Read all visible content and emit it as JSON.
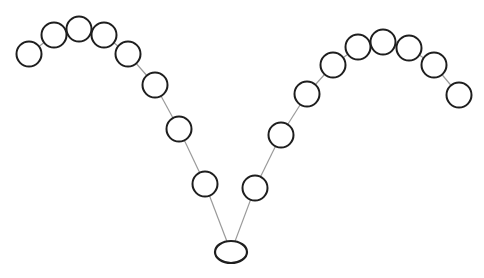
{
  "diagram": {
    "type": "node-chain",
    "background": "#ffffff",
    "node_stroke": "#1e1e1e",
    "link_stroke": "#9a9a9a",
    "node_radius": 12.5,
    "root": {
      "id": "root",
      "shape": "ellipse",
      "cx": 231,
      "cy": 252,
      "rx": 16,
      "ry": 11
    },
    "left_chain": [
      {
        "id": "L8",
        "cx": 205,
        "cy": 184
      },
      {
        "id": "L7",
        "cx": 179,
        "cy": 129
      },
      {
        "id": "L6",
        "cx": 155,
        "cy": 85
      },
      {
        "id": "L5",
        "cx": 128,
        "cy": 54
      },
      {
        "id": "L4",
        "cx": 104,
        "cy": 35
      },
      {
        "id": "L3",
        "cx": 79,
        "cy": 29
      },
      {
        "id": "L2",
        "cx": 54,
        "cy": 35
      },
      {
        "id": "L1",
        "cx": 29,
        "cy": 54
      }
    ],
    "right_chain": [
      {
        "id": "R1",
        "cx": 255,
        "cy": 188
      },
      {
        "id": "R2",
        "cx": 281,
        "cy": 135
      },
      {
        "id": "R3",
        "cx": 307,
        "cy": 94
      },
      {
        "id": "R4",
        "cx": 333,
        "cy": 65
      },
      {
        "id": "R5",
        "cx": 358,
        "cy": 47
      },
      {
        "id": "R6",
        "cx": 383,
        "cy": 42
      },
      {
        "id": "R7",
        "cx": 409,
        "cy": 48
      },
      {
        "id": "R8",
        "cx": 434,
        "cy": 65
      },
      {
        "id": "R9",
        "cx": 459,
        "cy": 95
      }
    ]
  }
}
